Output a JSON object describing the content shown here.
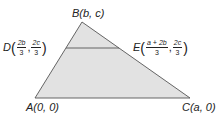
{
  "diagram": {
    "type": "triangle-with-midsegment",
    "colors": {
      "fill": "#e2e2e2",
      "stroke": "#555555",
      "text": "#222222"
    },
    "vertices": {
      "A": {
        "name": "A",
        "coords": "(0, 0)",
        "px": [
          35,
          98
        ]
      },
      "B": {
        "name": "B",
        "coords": "(b, c)",
        "px": [
          82,
          22
        ]
      },
      "C": {
        "name": "C",
        "coords": "(a, 0)",
        "px": [
          190,
          98
        ]
      },
      "D": {
        "name": "D",
        "px": [
          66,
          48
        ],
        "x_num": "2b",
        "x_den": "3",
        "y_num": "2c",
        "y_den": "3"
      },
      "E": {
        "name": "E",
        "px": [
          119,
          48
        ],
        "x_num": "a + 2b",
        "x_den": "3",
        "y_num": "2c",
        "y_den": "3"
      }
    },
    "labels": {
      "B": "B(b, c)",
      "A": "A(0, 0)",
      "C": "C(a, 0)",
      "open_paren": "(",
      "close_paren": ")",
      "comma": ","
    }
  }
}
